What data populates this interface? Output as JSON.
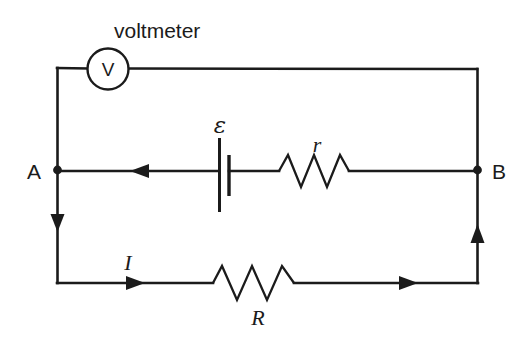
{
  "figure": {
    "kind": "circuit-diagram",
    "background_color": "#ffffff",
    "ink_color": "#1b1b1b",
    "width": 526,
    "height": 343
  },
  "labels": {
    "voltmeter_caption": "voltmeter",
    "meter_symbol": "V",
    "node_a": "A",
    "node_b": "B",
    "emf": "ε",
    "internal_resistance": "r",
    "current": "I",
    "load_resistance": "R"
  },
  "components": [
    {
      "name": "voltmeter",
      "symbol": "V",
      "caption": "voltmeter"
    },
    {
      "name": "battery",
      "symbol": "ε"
    },
    {
      "name": "internal-resistor",
      "symbol": "r"
    },
    {
      "name": "load-resistor",
      "symbol": "R"
    },
    {
      "name": "terminal-a",
      "symbol": "A"
    },
    {
      "name": "terminal-b",
      "symbol": "B"
    },
    {
      "name": "current-arrow",
      "symbol": "I"
    }
  ]
}
